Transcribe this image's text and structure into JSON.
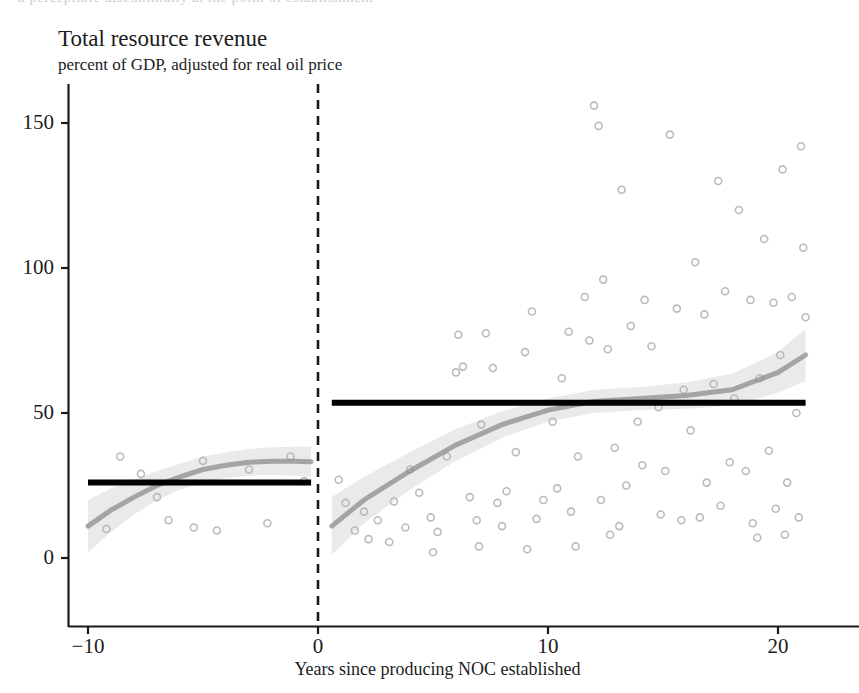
{
  "figure": {
    "top_clipped_text": "a perceptible discontinuity at the point of establishment",
    "background_color": "#ffffff"
  },
  "chart_data": {
    "type": "scatter",
    "title": "Total resource revenue",
    "subtitle": "percent of GDP, adjusted for real oil price",
    "xlabel": "Years since producing NOC established",
    "ylabel": "",
    "xlim": [
      -11.0,
      22.0
    ],
    "ylim": [
      -18.0,
      168.0
    ],
    "xticks": [
      -10,
      0,
      10,
      20
    ],
    "xtick_labels": [
      "−10",
      "0",
      "10",
      "20"
    ],
    "yticks": [
      0,
      50,
      100,
      150
    ],
    "ytick_labels": [
      "0",
      "50",
      "100",
      "150"
    ],
    "grid": false,
    "legend": null,
    "cutoff": {
      "x": 0,
      "style": "dashed",
      "color": "#1a1a1a",
      "label": "producing NOC established"
    },
    "rd_fit": {
      "left_mean": 26.0,
      "right_mean": 53.5,
      "jump": 27.5,
      "left_span": [
        -10.0,
        -0.3
      ],
      "right_span": [
        0.6,
        21.2
      ],
      "color": "#000000",
      "line_width": 6
    },
    "smoothers": [
      {
        "name": "left-local-polynomial",
        "side": "left",
        "color": "#8c8c8c",
        "band_color": "#d8d8d8",
        "x": [
          -10.0,
          -9.0,
          -8.0,
          -7.0,
          -6.0,
          -5.0,
          -4.0,
          -3.0,
          -2.0,
          -1.0,
          -0.3
        ],
        "y": [
          11.0,
          16.5,
          21.0,
          25.0,
          28.0,
          30.5,
          32.0,
          33.0,
          33.4,
          33.4,
          33.2
        ],
        "y_lower": [
          2.0,
          9.0,
          15.0,
          20.0,
          23.5,
          26.0,
          27.6,
          28.4,
          28.6,
          28.4,
          28.0
        ],
        "y_upper": [
          20.0,
          24.0,
          27.0,
          30.0,
          32.5,
          35.0,
          36.4,
          37.6,
          38.2,
          38.4,
          38.4
        ]
      },
      {
        "name": "right-local-polynomial",
        "side": "right",
        "color": "#8c8c8c",
        "band_color": "#d8d8d8",
        "x": [
          0.6,
          2.0,
          4.0,
          6.0,
          8.0,
          10.0,
          12.0,
          14.0,
          16.0,
          18.0,
          20.0,
          21.2
        ],
        "y": [
          11.0,
          20.0,
          30.0,
          39.0,
          46.0,
          51.0,
          54.0,
          55.0,
          56.0,
          58.0,
          64.0,
          70.0
        ],
        "y_lower": [
          1.0,
          12.0,
          23.5,
          33.5,
          41.5,
          47.0,
          50.0,
          51.0,
          51.5,
          52.5,
          57.0,
          61.0
        ],
        "y_upper": [
          21.0,
          28.0,
          36.5,
          44.5,
          50.5,
          55.0,
          58.0,
          59.0,
          60.5,
          63.5,
          71.0,
          79.0
        ]
      }
    ],
    "points": {
      "marker": "circle-open",
      "color": "#b4b4b4",
      "size": 7,
      "data": [
        [
          -8.6,
          35.0
        ],
        [
          -7.7,
          29.0
        ],
        [
          -5.4,
          10.5
        ],
        [
          -6.5,
          13.0
        ],
        [
          -4.4,
          9.5
        ],
        [
          -9.2,
          10.0
        ],
        [
          -3.0,
          30.5
        ],
        [
          -2.2,
          12.0
        ],
        [
          -1.2,
          35.0
        ],
        [
          -0.6,
          26.5
        ],
        [
          -7.0,
          21.0
        ],
        [
          -5.0,
          33.5
        ],
        [
          0.9,
          27.0
        ],
        [
          1.6,
          9.5
        ],
        [
          1.2,
          19.0
        ],
        [
          2.0,
          16.0
        ],
        [
          2.6,
          13.0
        ],
        [
          2.2,
          6.5
        ],
        [
          3.3,
          19.5
        ],
        [
          3.8,
          10.5
        ],
        [
          3.1,
          5.5
        ],
        [
          4.4,
          22.5
        ],
        [
          4.0,
          30.5
        ],
        [
          4.9,
          14.0
        ],
        [
          5.6,
          35.0
        ],
        [
          5.2,
          9.0
        ],
        [
          6.0,
          64.0
        ],
        [
          6.3,
          66.0
        ],
        [
          6.1,
          77.0
        ],
        [
          6.6,
          21.0
        ],
        [
          6.9,
          13.0
        ],
        [
          7.1,
          46.0
        ],
        [
          7.6,
          65.5
        ],
        [
          7.3,
          77.5
        ],
        [
          7.8,
          19.0
        ],
        [
          8.0,
          11.0
        ],
        [
          8.6,
          36.5
        ],
        [
          8.2,
          23.0
        ],
        [
          9.0,
          71.0
        ],
        [
          9.3,
          85.0
        ],
        [
          9.8,
          20.0
        ],
        [
          9.5,
          13.5
        ],
        [
          10.2,
          47.0
        ],
        [
          10.6,
          62.0
        ],
        [
          10.9,
          78.0
        ],
        [
          10.4,
          24.0
        ],
        [
          11.0,
          16.0
        ],
        [
          11.6,
          90.0
        ],
        [
          11.8,
          75.0
        ],
        [
          11.3,
          35.0
        ],
        [
          12.0,
          156.0
        ],
        [
          12.2,
          149.0
        ],
        [
          12.4,
          96.0
        ],
        [
          12.6,
          72.0
        ],
        [
          12.9,
          38.0
        ],
        [
          12.3,
          20.0
        ],
        [
          13.2,
          127.0
        ],
        [
          13.6,
          80.0
        ],
        [
          13.9,
          47.0
        ],
        [
          13.4,
          25.0
        ],
        [
          13.1,
          11.0
        ],
        [
          14.2,
          89.0
        ],
        [
          14.5,
          73.0
        ],
        [
          14.8,
          52.0
        ],
        [
          14.1,
          32.0
        ],
        [
          14.9,
          15.0
        ],
        [
          15.3,
          146.0
        ],
        [
          15.6,
          86.0
        ],
        [
          15.9,
          58.0
        ],
        [
          15.1,
          30.0
        ],
        [
          15.8,
          13.0
        ],
        [
          16.4,
          102.0
        ],
        [
          16.8,
          84.0
        ],
        [
          16.2,
          44.0
        ],
        [
          16.9,
          26.0
        ],
        [
          16.6,
          14.0
        ],
        [
          17.4,
          130.0
        ],
        [
          17.7,
          92.0
        ],
        [
          17.2,
          60.0
        ],
        [
          17.9,
          33.0
        ],
        [
          17.5,
          18.0
        ],
        [
          18.3,
          120.0
        ],
        [
          18.8,
          89.0
        ],
        [
          18.1,
          55.0
        ],
        [
          18.6,
          30.0
        ],
        [
          18.9,
          12.0
        ],
        [
          19.4,
          110.0
        ],
        [
          19.8,
          88.0
        ],
        [
          19.2,
          62.0
        ],
        [
          19.6,
          37.0
        ],
        [
          19.9,
          17.0
        ],
        [
          20.2,
          134.0
        ],
        [
          20.6,
          90.0
        ],
        [
          20.1,
          70.0
        ],
        [
          20.8,
          50.0
        ],
        [
          20.4,
          26.0
        ],
        [
          20.9,
          14.0
        ],
        [
          21.0,
          142.0
        ],
        [
          21.1,
          107.0
        ],
        [
          21.2,
          83.0
        ],
        [
          20.3,
          8.0
        ],
        [
          19.1,
          7.0
        ],
        [
          12.7,
          8.0
        ],
        [
          11.2,
          4.0
        ],
        [
          9.1,
          3.0
        ],
        [
          7.0,
          4.0
        ],
        [
          5.0,
          2.0
        ]
      ]
    }
  }
}
